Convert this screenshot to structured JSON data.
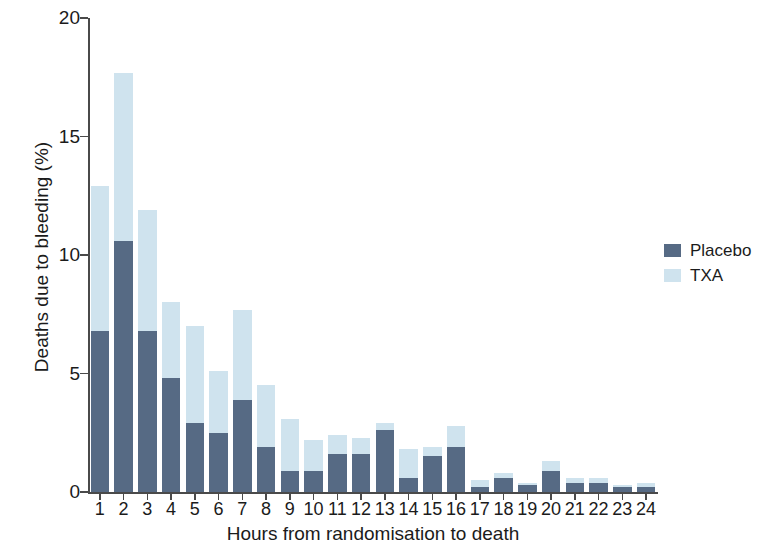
{
  "chart_data": {
    "type": "bar",
    "subtype": "stacked-bar",
    "title": "",
    "xlabel": "Hours from randomisation to death",
    "ylabel": "Deaths due to bleeding (%)",
    "categories": [
      "1",
      "2",
      "3",
      "4",
      "5",
      "6",
      "7",
      "8",
      "9",
      "10",
      "11",
      "12",
      "13",
      "14",
      "15",
      "16",
      "17",
      "18",
      "19",
      "20",
      "21",
      "22",
      "23",
      "24"
    ],
    "series": [
      {
        "name": "Placebo",
        "color": "#566a84",
        "values": [
          6.8,
          10.6,
          6.8,
          4.8,
          2.9,
          2.5,
          3.9,
          1.9,
          0.9,
          0.9,
          1.6,
          1.6,
          2.6,
          0.6,
          1.5,
          1.9,
          0.2,
          0.6,
          0.3,
          0.9,
          0.4,
          0.4,
          0.2,
          0.2
        ]
      },
      {
        "name": "TXA",
        "color": "#cfe3ee",
        "values": [
          6.1,
          7.1,
          5.1,
          3.2,
          4.1,
          2.6,
          3.8,
          2.6,
          2.2,
          1.3,
          0.8,
          0.7,
          0.3,
          1.2,
          0.4,
          0.9,
          0.3,
          0.2,
          0.1,
          0.4,
          0.2,
          0.2,
          0.1,
          0.2
        ]
      }
    ],
    "totals": [
      12.9,
      17.7,
      11.9,
      8.0,
      7.0,
      5.1,
      7.7,
      4.5,
      3.1,
      2.2,
      2.4,
      2.3,
      2.9,
      1.8,
      1.9,
      2.8,
      0.5,
      0.8,
      0.4,
      1.3,
      0.6,
      0.6,
      0.3,
      0.4
    ],
    "ylim": [
      0,
      20
    ],
    "yticks": [
      0,
      5,
      10,
      15,
      20
    ],
    "ytick_labels": [
      "0",
      "5",
      "10",
      "15",
      "20"
    ],
    "grid": false,
    "legend_position": "right",
    "legend": [
      {
        "label": "Placebo",
        "color": "#566a84"
      },
      {
        "label": "TXA",
        "color": "#cfe3ee"
      }
    ]
  }
}
